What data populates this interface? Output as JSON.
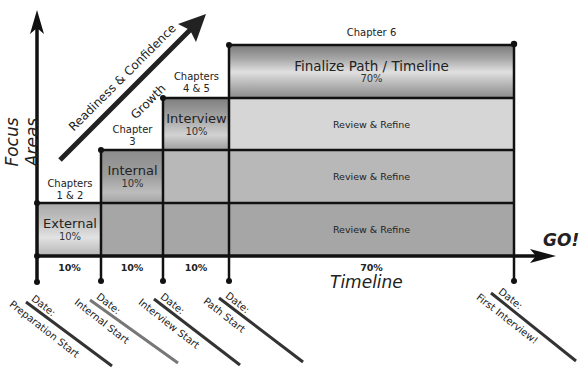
{
  "axes": {
    "y_label": "Focus Areas",
    "x_label": "Timeline",
    "go_label": "GO!",
    "growth_arrow": {
      "line1": "Readiness & Confidence",
      "line2": "Growth"
    }
  },
  "phases": [
    {
      "chapter": "Chapters\n1 & 2",
      "chapter_l1": "Chapters",
      "chapter_l2": "1 & 2",
      "name": "External",
      "pct": "10%",
      "bottom_pct": "10%"
    },
    {
      "chapter": "Chapter\n3",
      "chapter_l1": "Chapter",
      "chapter_l2": "3",
      "name": "Internal",
      "pct": "10%",
      "bottom_pct": "10%"
    },
    {
      "chapter": "Chapters\n4 & 5",
      "chapter_l1": "Chapters",
      "chapter_l2": "4 & 5",
      "name": "Interview",
      "pct": "10%",
      "bottom_pct": "10%"
    },
    {
      "chapter": "Chapter 6",
      "chapter_l1": "Chapter 6",
      "name": "Finalize Path / Timeline",
      "pct": "70%",
      "bottom_pct": "70%"
    }
  ],
  "review": {
    "row3": "Review & Refine",
    "row2": "Review & Refine",
    "row1": "Review & Refine"
  },
  "milestones": [
    {
      "date_label": "Date:",
      "name": "Preparation Start"
    },
    {
      "date_label": "Date:",
      "name": "Internal Start"
    },
    {
      "date_label": "Date:",
      "name": "Interview Start"
    },
    {
      "date_label": "Date:",
      "name": "Path Start"
    },
    {
      "date_label": "Date:",
      "name": "First Interview!"
    }
  ],
  "colors": {
    "axis": "#111111",
    "light_fill": "#d6d6d6",
    "mid_fill": "#b8b8b8",
    "dark_fill": "#a6a6a6"
  }
}
